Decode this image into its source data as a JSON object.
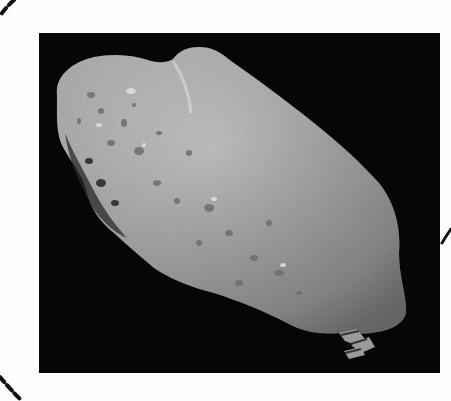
{
  "page": {
    "background": "#fdfdfd",
    "figure": {
      "subject": "asteroid photograph",
      "description": "Grayscale photograph of an elongated, cratered asteroid against a black space background",
      "background_color": "#060606",
      "asteroid_color": "#bdbdbd",
      "caption": ""
    },
    "decorations": {
      "left_arc": "dashed-circle-arc",
      "right_arc": "solid-circle-arc-fragment",
      "arc_color": "#111111"
    }
  }
}
